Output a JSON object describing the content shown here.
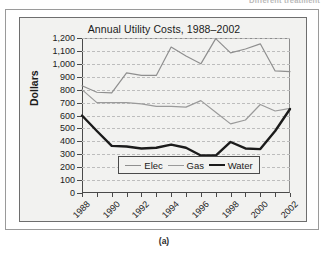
{
  "page": {
    "running_head": "Different treatment",
    "figure_caption": "(a)"
  },
  "chart_data": {
    "type": "line",
    "title": "Annual Utility Costs, 1988–2002",
    "xlabel": "",
    "ylabel": "Dollars",
    "x": [
      1988,
      1989,
      1990,
      1991,
      1992,
      1993,
      1994,
      1995,
      1996,
      1997,
      1998,
      1999,
      2000,
      2001,
      2002
    ],
    "xtick_labels": [
      "1988",
      "1990",
      "1992",
      "1994",
      "1996",
      "1998",
      "2000",
      "2002"
    ],
    "xtick_values": [
      1988,
      1990,
      1992,
      1994,
      1996,
      1998,
      2000,
      2002
    ],
    "xlim": [
      1988,
      2002
    ],
    "ylim": [
      0,
      1200
    ],
    "ytick_labels": [
      "0",
      "100",
      "200",
      "300",
      "400",
      "500",
      "600",
      "700",
      "800",
      "900",
      "1,000",
      "1,100",
      "1,200"
    ],
    "ytick_values": [
      0,
      100,
      200,
      300,
      400,
      500,
      600,
      700,
      800,
      900,
      1000,
      1100,
      1200
    ],
    "grid": true,
    "grid_style": "dashed-horizontal",
    "legend_position": "inside-bottom-center",
    "series": [
      {
        "name": "Elec",
        "color": "#8f8f8f",
        "width": 1.2,
        "values": [
          830,
          780,
          775,
          930,
          910,
          910,
          1130,
          1060,
          1000,
          1195,
          1085,
          1115,
          1155,
          945,
          940
        ]
      },
      {
        "name": "Gas",
        "color": "#9a9a9a",
        "width": 1.2,
        "values": [
          800,
          700,
          700,
          700,
          690,
          670,
          670,
          665,
          715,
          625,
          535,
          565,
          685,
          635,
          655
        ]
      },
      {
        "name": "Water",
        "color": "#1b1b1b",
        "width": 2.4,
        "values": [
          600,
          480,
          365,
          360,
          345,
          350,
          375,
          350,
          290,
          290,
          395,
          345,
          340,
          480,
          650
        ]
      }
    ]
  },
  "colors": {
    "panel_background": "#f2f2f0",
    "axis": "#4a4a4a",
    "grid": "#bdbdbd",
    "text": "#1b1b1b",
    "frame": "#9a9a9a"
  }
}
